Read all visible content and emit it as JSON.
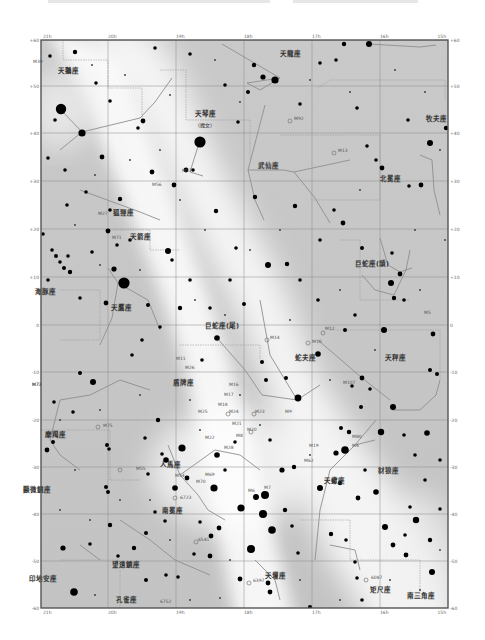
{
  "page": {
    "faint_top_text_present": true
  },
  "chart_data": {
    "type": "star_chart",
    "title": "",
    "ra_ticks": [
      "21h",
      "20h",
      "19h",
      "18h",
      "17h",
      "16h",
      "15h"
    ],
    "dec_ticks": [
      "+60",
      "+50",
      "+40",
      "+30",
      "+20",
      "+10",
      "0",
      "-10",
      "-20",
      "-30",
      "-40",
      "-50",
      "-60"
    ],
    "colors": {
      "background": "#cfcfcf",
      "milky_way": "#f7f7f7",
      "star": "#000000",
      "lines": "#9a9a9a",
      "border": "#555555",
      "text": "#333333"
    },
    "constellations": [
      {
        "name": "天龍座",
        "x": 290,
        "y": 56
      },
      {
        "name": "天鵝座",
        "x": 68,
        "y": 73
      },
      {
        "name": "天琴座",
        "x": 205,
        "y": 116
      },
      {
        "name": "(織女)",
        "x": 205,
        "y": 127
      },
      {
        "name": "牧夫座",
        "x": 436,
        "y": 121
      },
      {
        "name": "武仙座",
        "x": 268,
        "y": 168
      },
      {
        "name": "北冕座",
        "x": 390,
        "y": 181
      },
      {
        "name": "狐狸座",
        "x": 123,
        "y": 215
      },
      {
        "name": "天箭座",
        "x": 140,
        "y": 239
      },
      {
        "name": "巨蛇座(頭)",
        "x": 372,
        "y": 266
      },
      {
        "name": "海豚座",
        "x": 45,
        "y": 294
      },
      {
        "name": "天鷹座",
        "x": 121,
        "y": 310
      },
      {
        "name": "巨蛇座(尾)",
        "x": 222,
        "y": 328
      },
      {
        "name": "蛇夫座",
        "x": 305,
        "y": 360
      },
      {
        "name": "天秤座",
        "x": 395,
        "y": 360
      },
      {
        "name": "盾牌座",
        "x": 183,
        "y": 385
      },
      {
        "name": "摩羯座",
        "x": 55,
        "y": 437
      },
      {
        "name": "人馬座",
        "x": 170,
        "y": 467
      },
      {
        "name": "天蠍座",
        "x": 334,
        "y": 483
      },
      {
        "name": "豺狼座",
        "x": 388,
        "y": 473
      },
      {
        "name": "顯微鏡座",
        "x": 37,
        "y": 492
      },
      {
        "name": "南冕座",
        "x": 172,
        "y": 513
      },
      {
        "name": "望遠鏡座",
        "x": 126,
        "y": 567
      },
      {
        "name": "印地安座",
        "x": 43,
        "y": 581
      },
      {
        "name": "孔雀座",
        "x": 126,
        "y": 602
      },
      {
        "name": "天壇座",
        "x": 275,
        "y": 578
      },
      {
        "name": "矩尺座",
        "x": 380,
        "y": 592
      },
      {
        "name": "南三角座",
        "x": 421,
        "y": 598
      }
    ],
    "deep_sky": [
      {
        "name": "M39",
        "x": 33,
        "y": 63
      },
      {
        "name": "M92",
        "x": 294,
        "y": 120
      },
      {
        "name": "M13",
        "x": 338,
        "y": 152
      },
      {
        "name": "M57",
        "x": 182,
        "y": 172
      },
      {
        "name": "M56",
        "x": 152,
        "y": 186
      },
      {
        "name": "M27",
        "x": 98,
        "y": 215
      },
      {
        "name": "M71",
        "x": 112,
        "y": 239
      },
      {
        "name": "M5",
        "x": 424,
        "y": 314
      },
      {
        "name": "M12",
        "x": 325,
        "y": 330
      },
      {
        "name": "M14",
        "x": 270,
        "y": 339
      },
      {
        "name": "M10",
        "x": 312,
        "y": 343
      },
      {
        "name": "M11",
        "x": 176,
        "y": 360
      },
      {
        "name": "M26",
        "x": 185,
        "y": 369
      },
      {
        "name": "M16",
        "x": 229,
        "y": 386
      },
      {
        "name": "M17",
        "x": 224,
        "y": 396
      },
      {
        "name": "M18",
        "x": 218,
        "y": 406
      },
      {
        "name": "M25",
        "x": 198,
        "y": 413
      },
      {
        "name": "M24",
        "x": 229,
        "y": 413
      },
      {
        "name": "M23",
        "x": 255,
        "y": 413
      },
      {
        "name": "M9",
        "x": 285,
        "y": 413
      },
      {
        "name": "M107",
        "x": 343,
        "y": 384
      },
      {
        "name": "M72",
        "x": 32,
        "y": 386
      },
      {
        "name": "M73",
        "x": 32,
        "y": 386
      },
      {
        "name": "M75",
        "x": 103,
        "y": 427
      },
      {
        "name": "M21",
        "x": 232,
        "y": 425
      },
      {
        "name": "M20",
        "x": 247,
        "y": 431
      },
      {
        "name": "M8",
        "x": 236,
        "y": 437
      },
      {
        "name": "M22",
        "x": 205,
        "y": 439
      },
      {
        "name": "M28",
        "x": 224,
        "y": 449
      },
      {
        "name": "M19",
        "x": 309,
        "y": 447
      },
      {
        "name": "M62",
        "x": 304,
        "y": 462
      },
      {
        "name": "M4",
        "x": 352,
        "y": 447
      },
      {
        "name": "M80",
        "x": 352,
        "y": 438
      },
      {
        "name": "M55",
        "x": 136,
        "y": 470
      },
      {
        "name": "M54",
        "x": 175,
        "y": 477
      },
      {
        "name": "M69",
        "x": 205,
        "y": 476
      },
      {
        "name": "M70",
        "x": 196,
        "y": 483
      },
      {
        "name": "M7",
        "x": 264,
        "y": 489
      },
      {
        "name": "M6",
        "x": 248,
        "y": 492
      },
      {
        "name": "6723",
        "x": 180,
        "y": 499
      },
      {
        "name": "6541",
        "x": 198,
        "y": 541
      },
      {
        "name": "6397",
        "x": 253,
        "y": 582
      },
      {
        "name": "6087",
        "x": 371,
        "y": 579
      },
      {
        "name": "6752",
        "x": 160,
        "y": 603
      }
    ]
  }
}
